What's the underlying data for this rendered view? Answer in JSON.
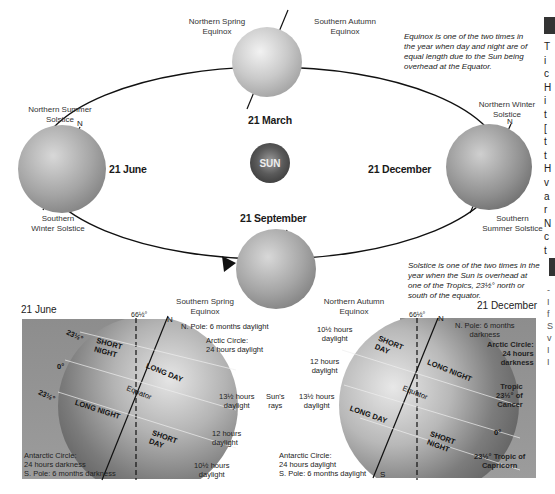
{
  "orbit": {
    "labels": {
      "northern_spring_equinox": "Northern Spring\nEquinox",
      "southern_autumn_equinox": "Southern Autumn\nEquinox",
      "northern_summer_solstice": "Northern Summer\nSolstice",
      "southern_winter_solstice": "Southern\nWinter Solstice",
      "northern_winter_solstice": "Northern Winter\nSolstice",
      "southern_summer_solstice": "Southern\nSummer Solstice",
      "southern_spring_equinox": "Southern Spring\nEquinox",
      "northern_autumn_equinox": "Northern Autumn\nEquinox"
    },
    "dates": {
      "march": "21 March",
      "june": "21 June",
      "september": "21 September",
      "december": "21 December"
    },
    "sun_label": "SUN",
    "north_marker": "N",
    "equinox_note": "Equinox is one of the two times in the year when day and night are of equal length due to the Sun being overhead at the Equator.",
    "solstice_note": "Solstice is one of the two times in the year when the Sun is overhead at one of the Tropics, 23½° north or south of the equator."
  },
  "june_panel": {
    "title": "21 June",
    "angle_top": "66½°",
    "north": "N",
    "n_pole": "N. Pole: 6 months daylight",
    "arctic": "Arctic Circle:\n24 hours daylight",
    "lat_top": "23½°",
    "lat_mid": "0°",
    "lat_bot": "23½°",
    "short_night": "SHORT\nNIGHT",
    "long_day": "LONG DAY",
    "equator": "Equator",
    "long_night": "LONG NIGHT",
    "short_day": "SHORT\nDAY",
    "antarctic": "Antarctic Circle:\n24 hours darkness\nS. Pole: 6 months darkness",
    "daylight_13": "13½ hours\ndaylight",
    "daylight_12": "12 hours\ndaylight",
    "daylight_10": "10½ hours\ndaylight"
  },
  "middle": {
    "sun_rays": "Sun's\nrays"
  },
  "december_panel": {
    "title": "21 December",
    "angle_top": "66½°",
    "north": "N",
    "south": "S",
    "n_pole": "N. Pole: 6 months\ndarkness",
    "arctic": "Arctic Circle:\n24 hours\ndarkness",
    "tropic_cancer": "Tropic\n23½° of\nCancer",
    "lat_mid": "0°",
    "tropic_capricorn": "23½° Tropic of\nCapricorn",
    "short_day": "SHORT\nDAY",
    "long_night": "LONG NIGHT",
    "equator": "Equator",
    "long_day": "LONG DAY",
    "short_night": "SHORT\nNIGHT",
    "daylight_10": "10½ hours\ndaylight",
    "daylight_12": "12 hours\ndaylight",
    "daylight_13": "13½ hours\ndaylight",
    "antarctic": "Antarctic Circle:\n24 hours daylight\nS. Pole: 6 months daylight"
  },
  "side_column": {
    "letters": [
      "T",
      "i",
      "c",
      "H",
      "i",
      "t",
      "[",
      "t",
      "t",
      "H",
      "v",
      "a",
      "r",
      "N",
      "c",
      "t"
    ],
    "letters2": [
      "-",
      "I",
      "f",
      "S",
      "v",
      "I",
      "I"
    ]
  }
}
